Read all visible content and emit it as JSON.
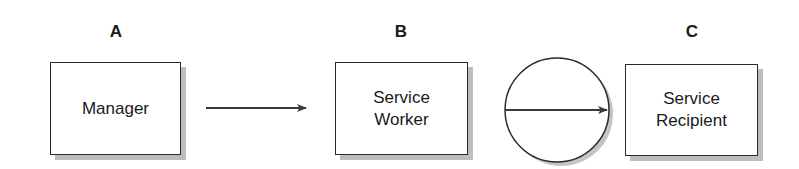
{
  "diagram": {
    "nodes": [
      {
        "id": "A",
        "label": "A",
        "text": "Manager"
      },
      {
        "id": "B",
        "label": "B",
        "text": "Service\nWorker"
      },
      {
        "id": "C",
        "label": "C",
        "text": "Service\nRecipient"
      }
    ],
    "edges": [
      {
        "from": "A",
        "to": "B",
        "style": "arrow"
      },
      {
        "from": "B",
        "to": "C",
        "style": "arrow-in-circle"
      }
    ],
    "colors": {
      "stroke": "#2a2a2a",
      "shadow": "#bdbdbd",
      "background": "#ffffff"
    }
  }
}
